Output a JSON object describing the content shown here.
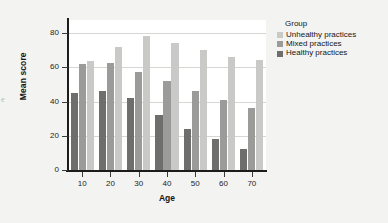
{
  "figure": {
    "background_color": "#f3f3f1",
    "plot_background_color": "#ffffff",
    "edge_artifact_text": "e"
  },
  "legend": {
    "title": "Group",
    "position": "right",
    "entries": [
      {
        "label": "Unhealthy practices",
        "color": "#c9c9c7"
      },
      {
        "label": "Mixed practices",
        "color": "#9b9b99"
      },
      {
        "label": "Healthy practices",
        "color": "#6e6e6c"
      }
    ]
  },
  "axes": {
    "x_title": "Age",
    "y_title": "Mean score",
    "y_ticks": [
      "0",
      "20",
      "40",
      "60",
      "80"
    ],
    "x_ticks": [
      "10",
      "20",
      "30",
      "40",
      "50",
      "60",
      "70"
    ]
  },
  "chart_data": {
    "type": "bar",
    "title": "",
    "xlabel": "Age",
    "ylabel": "Mean score",
    "categories": [
      "10",
      "20",
      "30",
      "40",
      "50",
      "60",
      "70"
    ],
    "ylim": [
      0,
      88
    ],
    "y_ticks": [
      0,
      20,
      40,
      60,
      80
    ],
    "grid": true,
    "grouped": true,
    "bar_order_in_group": [
      "Healthy practices",
      "Mixed practices",
      "Unhealthy practices"
    ],
    "legend_position": "right",
    "legend_title": "Group",
    "series": [
      {
        "name": "Unhealthy practices",
        "color": "#c9c9c7",
        "values": [
          63.5,
          72,
          78,
          74,
          70,
          66,
          64
        ]
      },
      {
        "name": "Mixed practices",
        "color": "#9b9b99",
        "values": [
          62,
          62.5,
          57,
          52,
          46,
          41,
          36
        ]
      },
      {
        "name": "Healthy practices",
        "color": "#6e6e6c",
        "values": [
          45,
          46,
          42,
          32,
          24,
          18,
          12
        ]
      }
    ]
  }
}
